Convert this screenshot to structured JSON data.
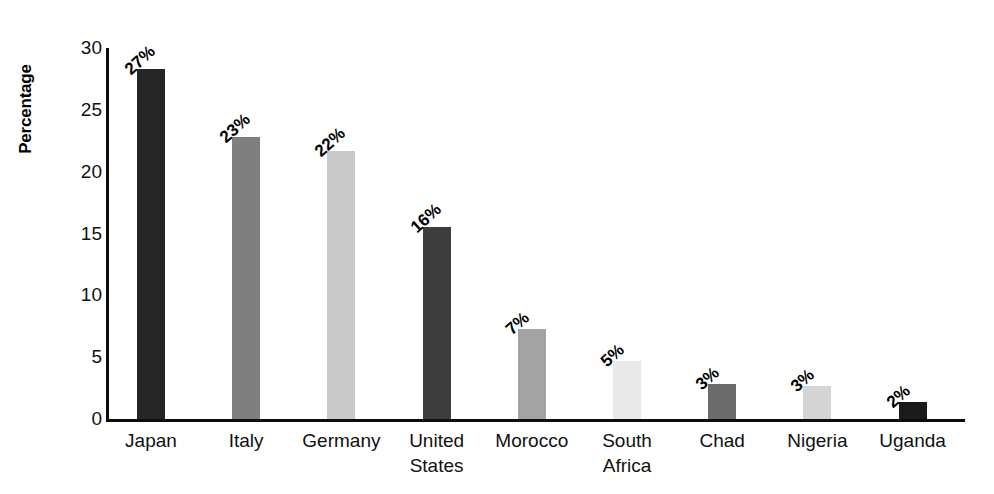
{
  "chart_data": {
    "type": "bar",
    "title": "",
    "xlabel": "",
    "ylabel": "Percentage",
    "ylim": [
      0,
      30
    ],
    "yticks": [
      30,
      25,
      20,
      15,
      10,
      5,
      0
    ],
    "grid": false,
    "legend": "none",
    "categories": [
      "Japan",
      "Italy",
      "Germany",
      "United States",
      "Morocco",
      "South Africa",
      "Chad",
      "Nigeria",
      "Uganda"
    ],
    "category_lines": [
      [
        "Japan",
        ""
      ],
      [
        "Italy",
        ""
      ],
      [
        "Germany",
        ""
      ],
      [
        "United",
        "States"
      ],
      [
        "Morocco",
        ""
      ],
      [
        "South",
        "Africa"
      ],
      [
        "Chad",
        ""
      ],
      [
        "Nigeria",
        ""
      ],
      [
        "Uganda",
        ""
      ]
    ],
    "values": [
      28.3,
      22.8,
      21.7,
      15.5,
      7.3,
      4.7,
      2.8,
      2.7,
      1.4
    ],
    "data_labels": [
      "27%",
      "23%",
      "22%",
      "16%",
      "7%",
      "5%",
      "3%",
      "3%",
      "2%"
    ],
    "bar_colors": [
      "#262626",
      "#7f7f7f",
      "#c9c9c9",
      "#3d3d3d",
      "#a3a3a3",
      "#e9e9e9",
      "#6b6b6b",
      "#d4d4d4",
      "#1a1a1a"
    ],
    "axis_color": "#0d0d0d",
    "background": "#ffffff"
  }
}
